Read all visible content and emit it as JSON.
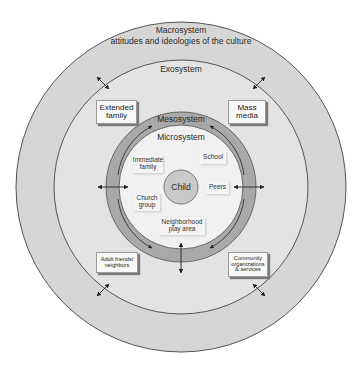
{
  "diagram": {
    "macrosystem": {
      "label": "Macrosystem",
      "sublabel": "attitudes and ideologies of the culture"
    },
    "exosystem": {
      "label": "Exosystem"
    },
    "mesosystem": {
      "label": "Mesosystem"
    },
    "microsystem": {
      "label": "Microsystem"
    },
    "center": {
      "label": "Child"
    },
    "exosystem_items": [
      {
        "line1": "Extended",
        "line2": "family"
      },
      {
        "line1": "Mass",
        "line2": "media"
      },
      {
        "line1": "Adult friends/",
        "line2": "neighbors"
      },
      {
        "line1": "Community",
        "line2": "organizations",
        "line3": "& services"
      }
    ],
    "microsystem_items": [
      {
        "line1": "Immediate",
        "line2": "family"
      },
      {
        "line1": "School"
      },
      {
        "line1": "Peers"
      },
      {
        "line1": "Church",
        "line2": "group"
      },
      {
        "line1": "Neighborhood",
        "line2": "play area"
      }
    ],
    "colors": {
      "macro_fill": "#d6d6d6",
      "exo_fill": "#e3e3e3",
      "meso_fill": "#a9a9a9",
      "micro_fill": "#f1f1f1",
      "child_fill": "#c9c9c9",
      "stroke": "#555555"
    }
  }
}
